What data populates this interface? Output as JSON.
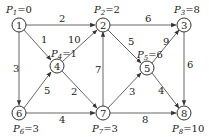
{
  "graph": {
    "nodes": [
      {
        "id": "1",
        "label": "1",
        "x": 19,
        "y": 25,
        "p_name": "P",
        "p_sub": "1",
        "p_value": "=0"
      },
      {
        "id": "2",
        "label": "2",
        "x": 103,
        "y": 25,
        "p_name": "P",
        "p_sub": "2",
        "p_value": "=2"
      },
      {
        "id": "3",
        "label": "3",
        "x": 184,
        "y": 25,
        "p_name": "P",
        "p_sub": "3",
        "p_value": "=8"
      },
      {
        "id": "4",
        "label": "4",
        "x": 57,
        "y": 66,
        "p_name": "P",
        "p_sub": "4",
        "p_value": "=1"
      },
      {
        "id": "5",
        "label": "5",
        "x": 147,
        "y": 68,
        "p_name": "P",
        "p_sub": "5",
        "p_value": "=6"
      },
      {
        "id": "6",
        "label": "6",
        "x": 19,
        "y": 113,
        "p_name": "P",
        "p_sub": "6",
        "p_value": "=3"
      },
      {
        "id": "7",
        "label": "7",
        "x": 103,
        "y": 113,
        "p_name": "P",
        "p_sub": "7",
        "p_value": "=3"
      },
      {
        "id": "8",
        "label": "8",
        "x": 184,
        "y": 113,
        "p_name": "P",
        "p_sub": "8",
        "p_value": "=10"
      }
    ],
    "edges": [
      {
        "from": "1",
        "to": "2",
        "weight": "2"
      },
      {
        "from": "1",
        "to": "4",
        "weight": "1"
      },
      {
        "from": "1",
        "to": "6",
        "weight": "3"
      },
      {
        "from": "4",
        "to": "2",
        "weight": "10"
      },
      {
        "from": "6",
        "to": "4",
        "weight": "5"
      },
      {
        "from": "4",
        "to": "7",
        "weight": "2"
      },
      {
        "from": "7",
        "to": "2",
        "weight": "7"
      },
      {
        "from": "6",
        "to": "7",
        "weight": "4"
      },
      {
        "from": "2",
        "to": "3",
        "weight": "6"
      },
      {
        "from": "2",
        "to": "5",
        "weight": "5"
      },
      {
        "from": "5",
        "to": "3",
        "weight": "9"
      },
      {
        "from": "7",
        "to": "5",
        "weight": "3"
      },
      {
        "from": "5",
        "to": "8",
        "weight": "4"
      },
      {
        "from": "7",
        "to": "8",
        "weight": "8"
      },
      {
        "from": "3",
        "to": "8",
        "weight": "6"
      }
    ]
  }
}
